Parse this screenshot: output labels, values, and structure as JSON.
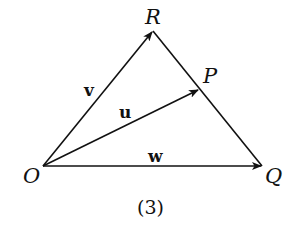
{
  "diagram": {
    "points": {
      "O": {
        "label": "O",
        "x": 43,
        "y": 166
      },
      "R": {
        "label": "R",
        "x": 153,
        "y": 31
      },
      "P": {
        "label": "P",
        "x": 199,
        "y": 89
      },
      "Q": {
        "label": "Q",
        "x": 262,
        "y": 166
      }
    },
    "vectors": {
      "v": {
        "label": "v",
        "from": "O",
        "to": "R"
      },
      "u": {
        "label": "u",
        "from": "O",
        "to": "P"
      },
      "w": {
        "label": "w",
        "from": "O",
        "to": "Q"
      }
    },
    "segments": [
      {
        "from": "R",
        "to": "Q"
      }
    ],
    "caption": "(3)",
    "stroke_color": "#111111"
  }
}
